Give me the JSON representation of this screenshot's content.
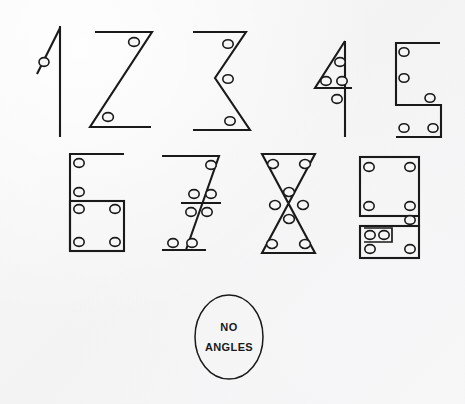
{
  "page": {
    "background_color": "#f6f6f6",
    "ink_color": "#1a1a1a",
    "width": 465,
    "height": 404
  },
  "legend": {
    "dot_meaning": "angle marker",
    "dot_style": "open circle"
  },
  "zero": {
    "shape": "oval",
    "line1": "NO",
    "line2": "ANGLES",
    "angle_count": 0,
    "cx": 229,
    "cy": 337,
    "rx": 34,
    "ry": 42
  },
  "digits": [
    {
      "digit": "1",
      "angle_count": 1,
      "shape": "vertical stroke with small diagonal flag",
      "origin_x": 30,
      "origin_y": 26,
      "dots": [
        [
          14,
          36
        ]
      ]
    },
    {
      "digit": "2",
      "angle_count": 2,
      "shape": "angular Z",
      "origin_x": 88,
      "origin_y": 26,
      "dots": [
        [
          49,
          14
        ],
        [
          24,
          90
        ]
      ]
    },
    {
      "digit": "3",
      "angle_count": 3,
      "shape": "double zigzag",
      "origin_x": 192,
      "origin_y": 26,
      "dots": [
        [
          38,
          14
        ],
        [
          36,
          52
        ],
        [
          40,
          91
        ]
      ]
    },
    {
      "digit": "4",
      "angle_count": 4,
      "shape": "triangle with vertical stem",
      "origin_x": 306,
      "origin_y": 26,
      "dots": [
        [
          36,
          33
        ],
        [
          18,
          57
        ],
        [
          33,
          57
        ],
        [
          26,
          73
        ]
      ]
    },
    {
      "digit": "5",
      "angle_count": 5,
      "shape": "angular S",
      "origin_x": 388,
      "origin_y": 32,
      "dots": [
        [
          9,
          12
        ],
        [
          9,
          38
        ],
        [
          49,
          58
        ],
        [
          10,
          90
        ],
        [
          44,
          90
        ]
      ]
    },
    {
      "digit": "6",
      "angle_count": 6,
      "shape": "flag over square box",
      "origin_x": 66,
      "origin_y": 150,
      "dots": [
        [
          9,
          11
        ],
        [
          9,
          42
        ],
        [
          9,
          59
        ],
        [
          54,
          59
        ],
        [
          9,
          91
        ],
        [
          54,
          91
        ]
      ]
    },
    {
      "digit": "7",
      "angle_count": 7,
      "shape": "crossed seven",
      "origin_x": 162,
      "origin_y": 150,
      "dots": [
        [
          52,
          12
        ],
        [
          32,
          45
        ],
        [
          46,
          45
        ],
        [
          30,
          61
        ],
        [
          45,
          61
        ],
        [
          9,
          95
        ],
        [
          28,
          95
        ]
      ]
    },
    {
      "digit": "8",
      "angle_count": 8,
      "shape": "bowtie / hourglass",
      "origin_x": 260,
      "origin_y": 150,
      "dots": [
        [
          13,
          11
        ],
        [
          50,
          11
        ],
        [
          30,
          43
        ],
        [
          16,
          56
        ],
        [
          44,
          56
        ],
        [
          30,
          70
        ],
        [
          13,
          100
        ],
        [
          48,
          100
        ]
      ]
    },
    {
      "digit": "9",
      "angle_count": 9,
      "shape": "square over notched box",
      "origin_x": 356,
      "origin_y": 150,
      "dots": [
        [
          10,
          12
        ],
        [
          54,
          12
        ],
        [
          10,
          49
        ],
        [
          54,
          49
        ],
        [
          54,
          64
        ],
        [
          12,
          80
        ],
        [
          24,
          80
        ],
        [
          12,
          95
        ],
        [
          54,
          95
        ]
      ]
    }
  ]
}
